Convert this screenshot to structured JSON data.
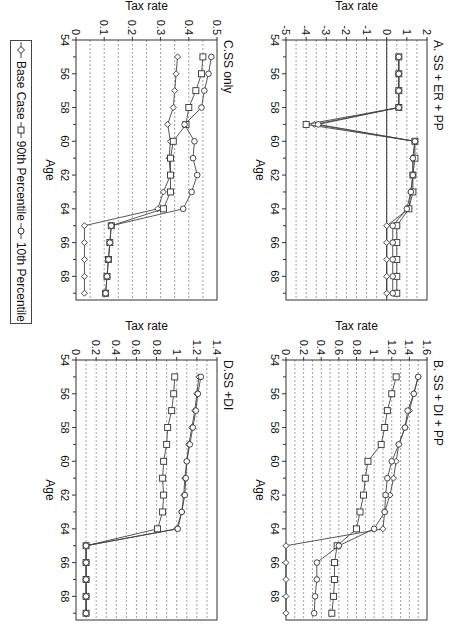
{
  "figure": {
    "rotation_deg": 90,
    "legend": [
      {
        "label": "Base Case",
        "marker": "diamond"
      },
      {
        "label": "90th Percentile",
        "marker": "square"
      },
      {
        "label": "10th Percentile",
        "marker": "circle"
      }
    ]
  },
  "chart_data": [
    {
      "id": "A",
      "type": "line",
      "title": "A. SS + ER + PP",
      "xlabel": "Age",
      "ylabel": "Tax rate",
      "xlim": [
        54,
        69
      ],
      "ylim": [
        -5,
        2
      ],
      "xticks": [
        54,
        56,
        58,
        60,
        62,
        64,
        66,
        68
      ],
      "yticks": [
        2,
        1,
        0,
        -1,
        -2,
        -3,
        -4,
        -5
      ],
      "grid": "horizontal dashed",
      "x": [
        55,
        56,
        57,
        58,
        59,
        60,
        61,
        62,
        63,
        64,
        65,
        66,
        67,
        68,
        69
      ],
      "series": [
        {
          "name": "Base Case",
          "values": [
            0.6,
            0.6,
            0.6,
            0.6,
            -3.6,
            1.4,
            1.3,
            1.3,
            1.2,
            1.1,
            0.0,
            0.0,
            0.0,
            0.0,
            0.0
          ]
        },
        {
          "name": "90th Percentile",
          "values": [
            0.6,
            0.6,
            0.6,
            0.6,
            -4.0,
            1.4,
            1.4,
            1.3,
            1.3,
            1.1,
            0.5,
            0.5,
            0.5,
            0.5,
            0.5
          ]
        },
        {
          "name": "10th Percentile",
          "values": [
            0.6,
            0.6,
            0.6,
            0.6,
            -3.4,
            1.4,
            1.3,
            1.3,
            1.2,
            1.0,
            0.3,
            0.3,
            0.3,
            0.3,
            0.3
          ]
        }
      ]
    },
    {
      "id": "B",
      "type": "line",
      "title": "B. SS + DI + PP",
      "xlabel": "Age",
      "ylabel": "Tax rate",
      "xlim": [
        54,
        69
      ],
      "ylim": [
        0,
        1.6
      ],
      "xticks": [
        54,
        56,
        58,
        60,
        62,
        64,
        66,
        68
      ],
      "yticks": [
        1.6,
        1.4,
        1.2,
        1,
        0.8,
        0.6,
        0.4,
        0.2,
        0
      ],
      "grid": "horizontal dashed",
      "x": [
        55,
        56,
        57,
        58,
        59,
        60,
        61,
        62,
        63,
        64,
        65,
        66,
        67,
        68,
        69
      ],
      "series": [
        {
          "name": "Base Case",
          "values": [
            1.5,
            1.45,
            1.4,
            1.35,
            1.28,
            1.25,
            1.22,
            1.18,
            1.12,
            1.1,
            0.0,
            0.0,
            0.0,
            0.0,
            0.0
          ]
        },
        {
          "name": "90th Percentile",
          "values": [
            1.25,
            1.2,
            1.15,
            1.12,
            1.08,
            0.93,
            0.9,
            0.88,
            0.84,
            0.8,
            0.58,
            0.55,
            0.55,
            0.54,
            0.52
          ]
        },
        {
          "name": "10th Percentile",
          "values": [
            1.5,
            1.45,
            1.38,
            1.35,
            1.28,
            1.2,
            1.15,
            1.13,
            1.12,
            1.0,
            0.6,
            0.35,
            0.35,
            0.33,
            0.32
          ]
        }
      ]
    },
    {
      "id": "C",
      "type": "line",
      "title": "C.SS only",
      "xlabel": "Age",
      "ylabel": "Tax rate",
      "xlim": [
        54,
        69
      ],
      "ylim": [
        0,
        0.5
      ],
      "xticks": [
        54,
        56,
        58,
        60,
        62,
        64,
        66,
        68
      ],
      "yticks": [
        0.5,
        0.4,
        0.3,
        0.2,
        0.1,
        0
      ],
      "grid": "horizontal dashed",
      "x": [
        55,
        56,
        57,
        58,
        59,
        60,
        61,
        62,
        63,
        64,
        65,
        66,
        67,
        68,
        69
      ],
      "series": [
        {
          "name": "Base Case",
          "values": [
            0.36,
            0.355,
            0.35,
            0.345,
            0.325,
            0.335,
            0.33,
            0.335,
            0.31,
            0.29,
            0.03,
            0.03,
            0.03,
            0.03,
            0.03
          ]
        },
        {
          "name": "90th Percentile",
          "values": [
            0.45,
            0.445,
            0.425,
            0.4,
            0.39,
            0.345,
            0.335,
            0.335,
            0.335,
            0.31,
            0.125,
            0.12,
            0.115,
            0.11,
            0.105
          ]
        },
        {
          "name": "10th Percentile",
          "values": [
            0.48,
            0.47,
            0.455,
            0.445,
            0.385,
            0.42,
            0.415,
            0.43,
            0.41,
            0.38,
            0.125,
            0.12,
            0.115,
            0.11,
            0.105
          ]
        }
      ]
    },
    {
      "id": "D",
      "type": "line",
      "title": "D.SS +DI",
      "xlabel": "Age",
      "ylabel": "Tax rate",
      "xlim": [
        54,
        69
      ],
      "ylim": [
        0,
        1.4
      ],
      "xticks": [
        54,
        56,
        58,
        60,
        62,
        64,
        66,
        68
      ],
      "yticks": [
        1.4,
        1.2,
        1,
        0.8,
        0.6,
        0.4,
        0.2,
        0
      ],
      "grid": "horizontal dashed",
      "x": [
        55,
        56,
        57,
        58,
        59,
        60,
        61,
        62,
        63,
        64,
        65,
        66,
        67,
        68,
        69
      ],
      "series": [
        {
          "name": "Base Case",
          "values": [
            1.22,
            1.2,
            1.18,
            1.15,
            1.12,
            1.1,
            1.08,
            1.07,
            1.05,
            1.0,
            0.1,
            0.1,
            0.1,
            0.1,
            0.1
          ]
        },
        {
          "name": "90th Percentile",
          "values": [
            0.98,
            0.97,
            0.95,
            0.91,
            0.9,
            0.87,
            0.86,
            0.87,
            0.86,
            0.81,
            0.1,
            0.1,
            0.1,
            0.1,
            0.1
          ]
        },
        {
          "name": "10th Percentile",
          "values": [
            1.24,
            1.21,
            1.19,
            1.16,
            1.13,
            1.1,
            1.09,
            1.08,
            1.05,
            1.01,
            0.1,
            0.1,
            0.1,
            0.1,
            0.1
          ]
        }
      ]
    }
  ]
}
